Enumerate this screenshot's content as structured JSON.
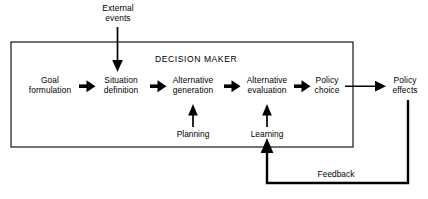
{
  "diagram": {
    "title": "DECISION MAKER",
    "canvas": {
      "width": 428,
      "height": 199,
      "background": "#ffffff",
      "stroke": "#000000"
    },
    "boundary": {
      "label": "DECISION MAKER",
      "x": 11,
      "y": 42,
      "width": 342,
      "height": 105
    },
    "nodes": [
      {
        "id": "external-events",
        "line1": "External",
        "line2": "events",
        "x": 118,
        "y": 14,
        "inside_boundary": false
      },
      {
        "id": "goal-formulation",
        "line1": "Goal",
        "line2": "formulation",
        "x": 50,
        "y": 86,
        "inside_boundary": true
      },
      {
        "id": "situation-definition",
        "line1": "Situation",
        "line2": "definition",
        "x": 121,
        "y": 86,
        "inside_boundary": true
      },
      {
        "id": "alternative-generation",
        "line1": "Alternative",
        "line2": "generation",
        "x": 193,
        "y": 86,
        "inside_boundary": true
      },
      {
        "id": "alternative-evaluation",
        "line1": "Alternative",
        "line2": "evaluation",
        "x": 267,
        "y": 86,
        "inside_boundary": true
      },
      {
        "id": "policy-choice",
        "line1": "Policy",
        "line2": "choice",
        "x": 327,
        "y": 86,
        "inside_boundary": true
      },
      {
        "id": "policy-effects",
        "line1": "Policy",
        "line2": "effects",
        "x": 405,
        "y": 86,
        "inside_boundary": false
      }
    ],
    "aux_labels": [
      {
        "id": "planning",
        "text": "Planning",
        "x": 193,
        "y": 135
      },
      {
        "id": "learning",
        "text": "Learning",
        "x": 267,
        "y": 135
      },
      {
        "id": "feedback",
        "text": "Feedback",
        "x": 336,
        "y": 175
      }
    ],
    "flows": [
      {
        "from": "goal-formulation",
        "to": "situation-definition",
        "style": "thick-arrow"
      },
      {
        "from": "situation-definition",
        "to": "alternative-generation",
        "style": "thick-arrow"
      },
      {
        "from": "alternative-generation",
        "to": "alternative-evaluation",
        "style": "thick-arrow"
      },
      {
        "from": "alternative-evaluation",
        "to": "policy-choice",
        "style": "thick-arrow"
      },
      {
        "from": "policy-choice",
        "to": "policy-effects",
        "style": "line-arrow"
      },
      {
        "from": "external-events",
        "to": "situation-definition",
        "style": "down-arrow"
      },
      {
        "from": "planning",
        "to": "alternative-generation",
        "style": "up-arrow"
      },
      {
        "from": "learning",
        "to": "alternative-evaluation",
        "style": "up-arrow"
      },
      {
        "from": "policy-effects",
        "to": "learning",
        "style": "feedback-loop"
      }
    ]
  }
}
